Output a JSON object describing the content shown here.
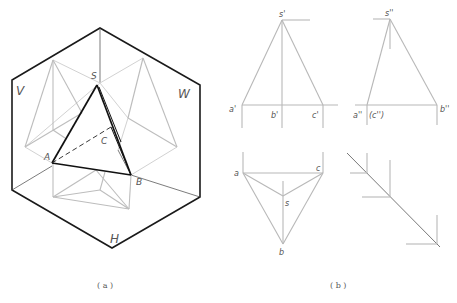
{
  "figure_a": {
    "caption": "( a )",
    "plane_labels": {
      "V": "V",
      "W": "W",
      "H": "H"
    },
    "point_labels": {
      "S": "S",
      "A": "A",
      "B": "B",
      "C": "C"
    }
  },
  "figure_b": {
    "caption": "( b )",
    "front_view": {
      "s": "s'",
      "a": "a'",
      "b": "b'",
      "c": "c'"
    },
    "side_view": {
      "s": "s''",
      "a": "a''",
      "c": "(c'')",
      "b": "b''"
    },
    "top_view": {
      "a": "a",
      "c": "c",
      "s": "s",
      "b": "b"
    }
  },
  "colors": {
    "outline": "#1a1a1a",
    "projection_gray": "#bdbdbd",
    "label": "#555555"
  }
}
